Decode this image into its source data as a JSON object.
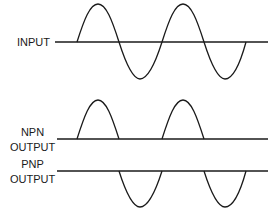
{
  "labels": {
    "input": "INPUT",
    "npn_line1": "NPN",
    "npn_line2": "OUTPUT",
    "pnp_line1": "PNP",
    "pnp_line2": "OUTPUT"
  },
  "colors": {
    "stroke": "#1a1a1a",
    "background": "#ffffff"
  },
  "waveforms": [
    {
      "name": "input",
      "type": "full sine",
      "cycles": 2
    },
    {
      "name": "npn-output",
      "type": "positive half-wave",
      "pulses": 2
    },
    {
      "name": "pnp-output",
      "type": "negative half-wave",
      "pulses": 2
    }
  ]
}
